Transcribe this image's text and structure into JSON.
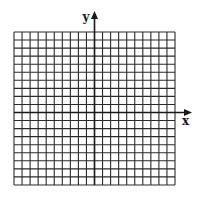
{
  "diagram": {
    "type": "coordinate-grid",
    "x_axis_label": "x",
    "y_axis_label": "y",
    "grid": {
      "columns": 20,
      "rows": 19,
      "columns_left_of_y_axis": 10,
      "columns_right_of_y_axis": 10,
      "rows_above_x_axis": 10,
      "rows_below_x_axis": 9
    },
    "colors": {
      "grid_line": "#2a2a2a",
      "axis_line": "#1a1a1a",
      "background": "#ffffff"
    }
  }
}
